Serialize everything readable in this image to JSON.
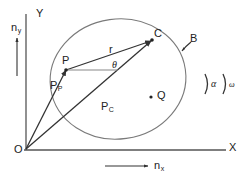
{
  "figure": {
    "type": "vector-kinematics-diagram",
    "stroke_color": "#333333",
    "outline_color": "#666666",
    "background": "#ffffff"
  },
  "axes": {
    "y_axis_label": "Y",
    "x_axis_label": "X",
    "origin_label": "O",
    "unit_vector_y": {
      "base": "n",
      "sub": "y"
    },
    "unit_vector_x": {
      "base": "n",
      "sub": "x"
    }
  },
  "body": {
    "label": "B",
    "shape": "ellipse",
    "center_x": 118,
    "center_y": 79,
    "radius_x": 68,
    "radius_y": 60,
    "rotation_deg": -8
  },
  "points": {
    "origin": {
      "label": "O",
      "x": 26,
      "y": 148
    },
    "p": {
      "label": "P",
      "x": 66,
      "y": 70
    },
    "c": {
      "label": "C",
      "x": 152,
      "y": 40
    },
    "q": {
      "label": "Q",
      "x": 154,
      "y": 96
    }
  },
  "vectors": [
    {
      "name": "position-vector-to-P",
      "label": {
        "base": "P",
        "sub": "P"
      },
      "from": "origin",
      "to": "p"
    },
    {
      "name": "position-vector-to-C",
      "label": {
        "base": "P",
        "sub": "C"
      },
      "from": "origin",
      "to": "c"
    },
    {
      "name": "relative-vector-r",
      "label": {
        "base": "r",
        "sub": ""
      },
      "from": "p",
      "to": "c"
    }
  ],
  "angles": {
    "theta": {
      "label": "θ",
      "vertex": "P",
      "description": "angle between the horizontal reference line at P and vector r"
    },
    "alpha": {
      "label": "α",
      "description": "angular acceleration arc symbol"
    },
    "omega": {
      "label": "ω",
      "description": "angular velocity arc symbol"
    }
  },
  "labels_text": {
    "Y": "Y",
    "X": "X",
    "O": "O",
    "P": "P",
    "C": "C",
    "Q": "Q",
    "B": "B",
    "r": "r",
    "theta": "θ",
    "alpha": "α",
    "omega": "ω",
    "n": "n",
    "sub_y": "y",
    "sub_x": "x",
    "sub_P": "P",
    "sub_C": "C"
  }
}
